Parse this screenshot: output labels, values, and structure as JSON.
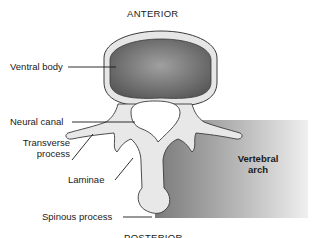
{
  "orientation": {
    "top": "ANTERIOR",
    "bottom": "POSTERIOR"
  },
  "labels": {
    "ventral_body": "Ventral body",
    "neural_canal": "Neural canal",
    "transverse_process_line1": "Transverse",
    "transverse_process_line2": "process",
    "laminae": "Laminae",
    "spinous_process": "Spinous process"
  },
  "region": {
    "vertebral_arch_line1": "Vertebral",
    "vertebral_arch_line2": "arch"
  },
  "colors": {
    "bone": "#e6e6e6",
    "body_fill": "#6a6a6a",
    "arch_shade_dark": "#7a7a7a",
    "arch_shade_light": "#ededed",
    "outline": "#3a3a3a"
  }
}
